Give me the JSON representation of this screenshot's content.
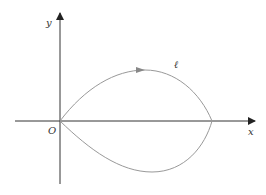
{
  "diagram": {
    "axes": {
      "x_label": "x",
      "y_label": "y",
      "origin_label": "O",
      "axis_color": "#333333"
    },
    "curve": {
      "label": "ℓ",
      "color": "#999999",
      "description": "closed teardrop-shaped loop starting and ending at origin O, crossing x-axis at right, with direction arrow on upper arc pointing right"
    }
  }
}
